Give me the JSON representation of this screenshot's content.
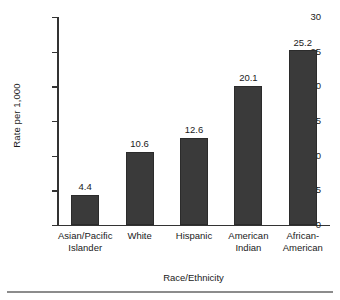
{
  "chart_data": {
    "type": "bar",
    "title": "",
    "xlabel": "Race/Ethnicity",
    "ylabel": "Rate per 1,000",
    "categories": [
      "Asian/Pacific Islander",
      "White",
      "Hispanic",
      "American Indian",
      "African-American"
    ],
    "category_lines": [
      [
        "Asian/Pacific",
        "Islander"
      ],
      [
        "White"
      ],
      [
        "Hispanic"
      ],
      [
        "American",
        "Indian"
      ],
      [
        "African-",
        "American"
      ]
    ],
    "values": [
      4.4,
      10.6,
      12.6,
      20.1,
      25.2
    ],
    "value_labels": [
      "4.4",
      "10.6",
      "12.6",
      "20.1",
      "25.2"
    ],
    "ylim": [
      0,
      30
    ],
    "yticks": [
      0,
      5,
      10,
      15,
      20,
      25,
      30
    ],
    "ytick_labels": [
      "0",
      "5",
      "10",
      "15",
      "20",
      "25",
      "30"
    ],
    "grid": false,
    "legend": "none",
    "bar_color": "#3a3a3a",
    "bar_edge_color": "#2b2b2b",
    "axis_color": "#333333",
    "background_color": "#ffffff",
    "rule_color": "#8c8c8c"
  }
}
